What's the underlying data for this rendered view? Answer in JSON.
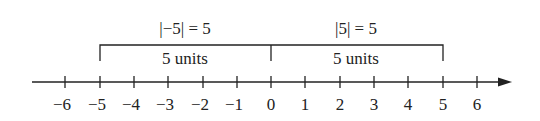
{
  "diagram": {
    "left_equation": "|−5| = 5",
    "right_equation": "|5| = 5",
    "left_span_label": "5 units",
    "right_span_label": "5 units",
    "ticks": [
      "−6",
      "−5",
      "−4",
      "−3",
      "−2",
      "−1",
      "0",
      "1",
      "2",
      "3",
      "4",
      "5",
      "6"
    ],
    "colors": {
      "line": "#222222",
      "background": "#ffffff"
    }
  }
}
